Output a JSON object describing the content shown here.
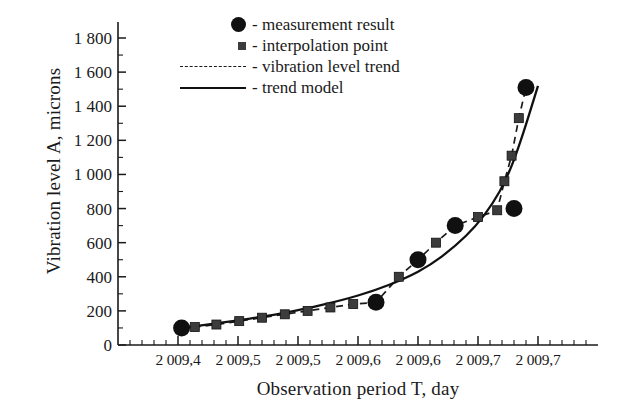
{
  "chart_data": {
    "type": "line",
    "title": "",
    "xlabel": "Observation period  T, day",
    "ylabel": "Vibration level A, microns",
    "xlim": [
      2009.35,
      2009.75
    ],
    "ylim": [
      0,
      1800
    ],
    "grid": false,
    "legend_position": "top-left-inside",
    "xticks": [
      "2 009,4",
      "2 009,5",
      "2 009,5",
      "2 009,6",
      "2 009,6",
      "2 009,7",
      "2 009,7"
    ],
    "xtick_values": [
      2009.4,
      2009.45,
      2009.5,
      2009.55,
      2009.6,
      2009.65,
      2009.7
    ],
    "yticks": [
      "0",
      "200",
      "400",
      "600",
      "800",
      "1 000",
      "1 200",
      "1 400",
      "1 600",
      "1 800"
    ],
    "ytick_values": [
      0,
      200,
      400,
      600,
      800,
      1000,
      1200,
      1400,
      1600,
      1800
    ],
    "series": [
      {
        "name": "measurement result",
        "marker": "circle",
        "style": "markers",
        "color": "#101010",
        "x": [
          2009.403,
          2009.565,
          2009.6,
          2009.631,
          2009.68,
          2009.69
        ],
        "y": [
          100,
          250,
          500,
          700,
          800,
          1510
        ]
      },
      {
        "name": "interpolation point",
        "marker": "square",
        "style": "markers",
        "color": "#3c3c3c",
        "x": [
          2009.414,
          2009.432,
          2009.451,
          2009.47,
          2009.489,
          2009.508,
          2009.527,
          2009.546,
          2009.584,
          2009.615,
          2009.65,
          2009.666,
          2009.672,
          2009.678,
          2009.684
        ],
        "y": [
          105,
          120,
          140,
          160,
          180,
          200,
          220,
          240,
          400,
          600,
          750,
          790,
          960,
          1110,
          1330
        ]
      },
      {
        "name": "vibration level trend",
        "style": "dashed-line",
        "color": "#1a1a1a",
        "x": [
          2009.403,
          2009.414,
          2009.432,
          2009.451,
          2009.47,
          2009.489,
          2009.508,
          2009.527,
          2009.546,
          2009.565,
          2009.584,
          2009.6,
          2009.615,
          2009.631,
          2009.65,
          2009.666,
          2009.672,
          2009.678,
          2009.684,
          2009.69
        ],
        "y": [
          100,
          105,
          120,
          140,
          160,
          180,
          200,
          220,
          240,
          250,
          400,
          500,
          600,
          700,
          750,
          790,
          960,
          1110,
          1330,
          1510
        ]
      },
      {
        "name": "trend model",
        "style": "solid-line",
        "color": "#111111",
        "x": [
          2009.403,
          2009.43,
          2009.46,
          2009.49,
          2009.52,
          2009.55,
          2009.575,
          2009.6,
          2009.62,
          2009.64,
          2009.655,
          2009.668,
          2009.678,
          2009.688,
          2009.7
        ],
        "y": [
          100,
          125,
          155,
          190,
          235,
          290,
          350,
          430,
          520,
          640,
          760,
          900,
          1050,
          1250,
          1520
        ]
      }
    ],
    "legend": [
      {
        "marker": "circle",
        "label": "- measurement result"
      },
      {
        "marker": "square",
        "label": "- interpolation point"
      },
      {
        "marker": "dashed",
        "label": "- vibration level trend"
      },
      {
        "marker": "solid",
        "label": "- trend model"
      }
    ]
  },
  "axes": {
    "y_title": "Vibration level A, microns",
    "x_title": "Observation period  T, day"
  }
}
